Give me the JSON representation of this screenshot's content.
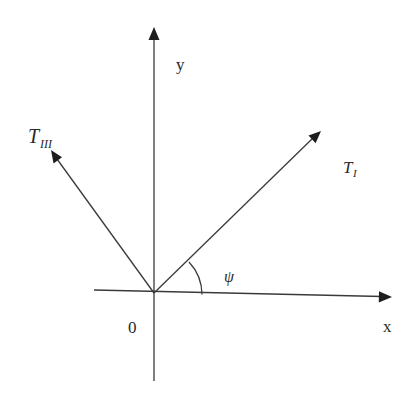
{
  "diagram": {
    "type": "vector-diagram",
    "axes": {
      "x_label": "x",
      "y_label": "y",
      "origin_label": "0"
    },
    "vectors": [
      {
        "id": "T_I",
        "label_main": "T",
        "label_sub": "I",
        "direction": "upper-right"
      },
      {
        "id": "T_III",
        "label_main": "T",
        "label_sub": "III",
        "direction": "upper-left"
      }
    ],
    "angle": {
      "symbol": "ψ",
      "between": [
        "x-axis",
        "T_I"
      ]
    },
    "colors": {
      "line": "#3a3a3a",
      "text": "#2a2a2a",
      "background": "#ffffff"
    }
  }
}
